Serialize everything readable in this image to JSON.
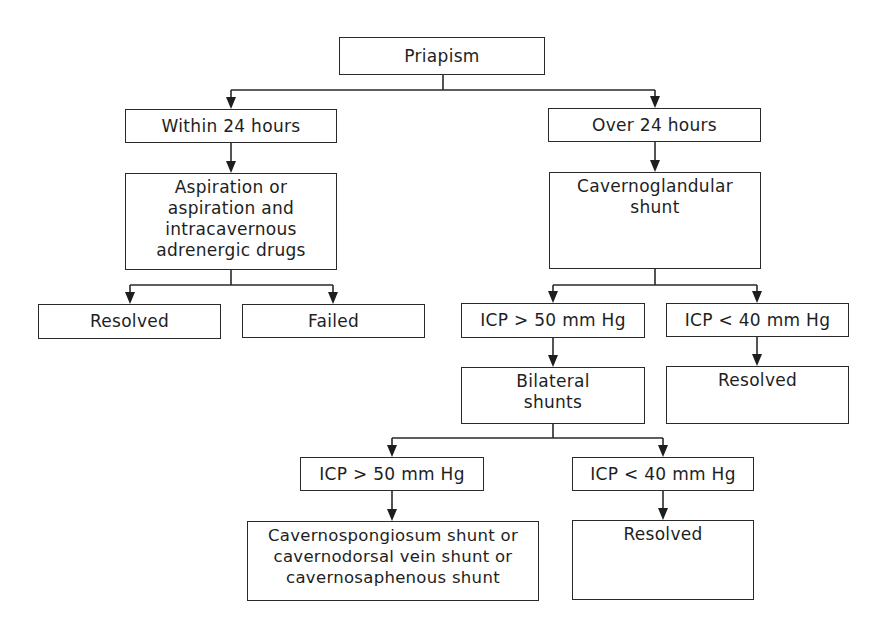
{
  "diagram": {
    "type": "flowchart",
    "title": "Priapism",
    "colors": {
      "line": "#2a2a2a",
      "text": "#1e1e1e",
      "background": "#ffffff"
    },
    "nodes": {
      "priapism": {
        "label": "Priapism"
      },
      "within_24": {
        "label": "Within 24 hours"
      },
      "aspiration": {
        "label": "Aspiration or\naspiration and\nintracavernous\nadrenergic drugs"
      },
      "resolved_1": {
        "label": "Resolved"
      },
      "failed": {
        "label": "Failed"
      },
      "over_24": {
        "label": "Over 24 hours"
      },
      "cavernoglandular": {
        "label": "Cavernoglandular\nshunt"
      },
      "icp_gt50_1": {
        "label": "ICP > 50 mm Hg"
      },
      "icp_lt40_1": {
        "label": "ICP < 40 mm Hg"
      },
      "bilateral": {
        "label": "Bilateral\nshunts"
      },
      "resolved_2": {
        "label": "Resolved"
      },
      "icp_gt50_2": {
        "label": "ICP > 50 mm Hg"
      },
      "icp_lt40_2": {
        "label": "ICP < 40 mm Hg"
      },
      "cavernospongiosum": {
        "label": "Cavernospongiosum shunt or\ncavernodorsal vein shunt or\ncavernosaphenous shunt"
      },
      "resolved_3": {
        "label": "Resolved"
      }
    },
    "edges": [
      [
        "priapism",
        "within_24"
      ],
      [
        "priapism",
        "over_24"
      ],
      [
        "within_24",
        "aspiration"
      ],
      [
        "aspiration",
        "resolved_1"
      ],
      [
        "aspiration",
        "failed"
      ],
      [
        "over_24",
        "cavernoglandular"
      ],
      [
        "cavernoglandular",
        "icp_gt50_1"
      ],
      [
        "cavernoglandular",
        "icp_lt40_1"
      ],
      [
        "icp_gt50_1",
        "bilateral"
      ],
      [
        "icp_lt40_1",
        "resolved_2"
      ],
      [
        "bilateral",
        "icp_gt50_2"
      ],
      [
        "bilateral",
        "icp_lt40_2"
      ],
      [
        "icp_gt50_2",
        "cavernospongiosum"
      ],
      [
        "icp_lt40_2",
        "resolved_3"
      ]
    ]
  }
}
